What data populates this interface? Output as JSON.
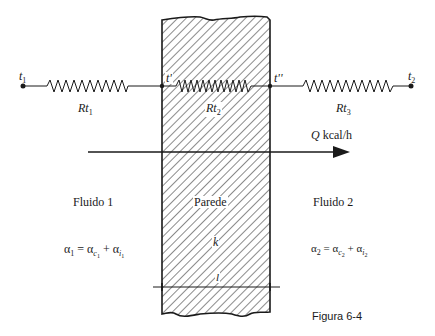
{
  "figure": {
    "caption": "Figura 6-4",
    "colors": {
      "line": "#1a1a1a",
      "background": "#ffffff",
      "hatch": "#2a2a2a"
    }
  },
  "nodes": {
    "t1": {
      "symbol": "t",
      "sub": "1"
    },
    "t_prime": {
      "symbol": "t'"
    },
    "t_double_prime": {
      "symbol": "t''"
    },
    "t2": {
      "symbol": "t",
      "sub": "2"
    }
  },
  "resistances": [
    {
      "symbol": "Rt",
      "sub": "1"
    },
    {
      "symbol": "Rt",
      "sub": "2"
    },
    {
      "symbol": "Rt",
      "sub": "3"
    }
  ],
  "heat_flow": {
    "symbol": "Q",
    "unit": "kcal/h"
  },
  "wall": {
    "label": "Parede",
    "conductivity": "k",
    "thickness": "l"
  },
  "fluids": [
    {
      "label": "Fluido 1",
      "eq_lhs": "α",
      "eq_lhs_sub": "1",
      "eq_mid": "= α",
      "eq_mid_sub": "c",
      "eq_mid_subsub": "1",
      "eq_plus": "+ α",
      "eq_end_sub": "i",
      "eq_end_subsub": "1"
    },
    {
      "label": "Fluido 2",
      "eq_lhs": "α",
      "eq_lhs_sub": "2",
      "eq_mid": "= α",
      "eq_mid_sub": "c",
      "eq_mid_subsub": "2",
      "eq_plus": "+ α",
      "eq_end_sub": "i",
      "eq_end_subsub": "2"
    }
  ]
}
